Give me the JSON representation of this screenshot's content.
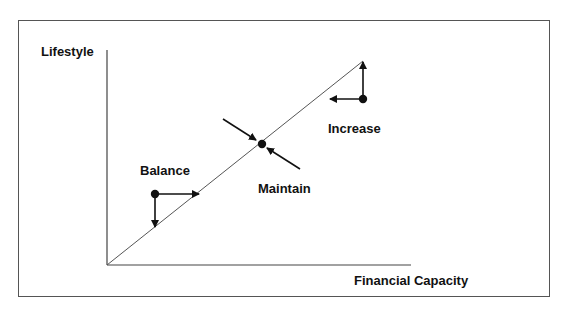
{
  "diagram": {
    "y_axis_label": "Lifestyle",
    "x_axis_label": "Financial Capacity",
    "points": [
      {
        "label": "Balance",
        "description": "Dot above line with arrows right and down toward the line"
      },
      {
        "label": "Maintain",
        "description": "Dot on the line with two arrows pointing toward it from both sides"
      },
      {
        "label": "Increase",
        "description": "Dot below line end with arrows up and left"
      }
    ],
    "colors": {
      "line": "#555555",
      "arrow": "#111111",
      "border": "#555555"
    }
  }
}
